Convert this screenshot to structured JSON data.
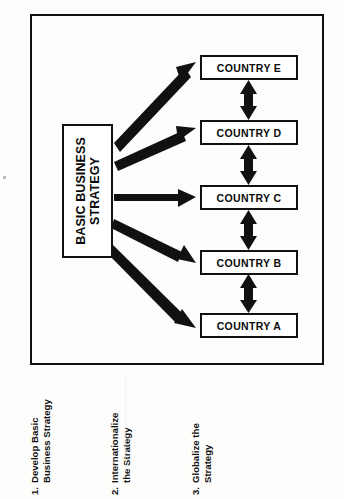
{
  "figure": {
    "type": "business-strategy-globalization-diagram",
    "frame": {
      "border_color": "#111111"
    },
    "strategy_box": {
      "label": "BASIC BUSINESS STRATEGY",
      "line1": "BASIC BUSINESS",
      "line2": "STRATEGY",
      "orientation": "rotated-90-ccw"
    },
    "country_boxes": [
      {
        "id": "e",
        "label": "COUNTRY  E"
      },
      {
        "id": "d",
        "label": "COUNTRY  D"
      },
      {
        "id": "c",
        "label": "COUNTRY  C"
      },
      {
        "id": "b",
        "label": "COUNTRY  B"
      },
      {
        "id": "a",
        "label": "COUNTRY  A"
      }
    ],
    "connectors": {
      "strategy_to_country": "thick-tapered-arrow",
      "country_to_country": "double-headed-vertical-arrow",
      "count_strategy_arrows": 5,
      "count_double_arrows": 4
    },
    "captions": [
      {
        "number": "1.",
        "line1": "Develop Basic",
        "line2": "Business Strategy",
        "full": "1. Develop Basic Business Strategy"
      },
      {
        "number": "2.",
        "line1": "Internationalize",
        "line2": "the Strategy",
        "full": "2. Internationalize the Strategy"
      },
      {
        "number": "3.",
        "line1": "Globalize the",
        "line2": "Strategy",
        "full": "3. Globalize the Strategy"
      }
    ],
    "colors": {
      "ink": "#111111",
      "paper": "#fdfdfc"
    }
  }
}
